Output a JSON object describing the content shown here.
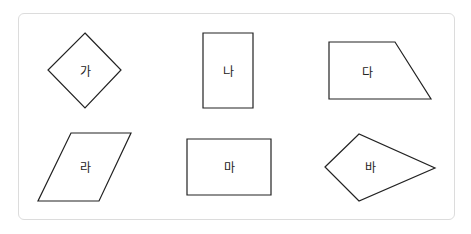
{
  "figure": {
    "shapes": [
      {
        "label": "가",
        "type": "square-rotated",
        "points": "85,33 121,70 85,108 48,70",
        "label_pos": [
          85,
          72
        ]
      },
      {
        "label": "나",
        "type": "rectangle",
        "points": "203,33 253,33 253,108 203,108",
        "label_pos": [
          228,
          72
        ]
      },
      {
        "label": "다",
        "type": "trapezoid",
        "points": "329,42 395,42 431,99 329,99",
        "label_pos": [
          367,
          73
        ]
      },
      {
        "label": "라",
        "type": "parallelogram",
        "points": "71,133 131,133 99,201 38,201",
        "label_pos": [
          85,
          168
        ]
      },
      {
        "label": "마",
        "type": "rectangle",
        "points": "187,139 271,139 271,195 187,195",
        "label_pos": [
          229,
          168
        ]
      },
      {
        "label": "바",
        "type": "kite",
        "points": "325,167 359,134 435,168 359,201",
        "label_pos": [
          370,
          168
        ]
      }
    ]
  }
}
